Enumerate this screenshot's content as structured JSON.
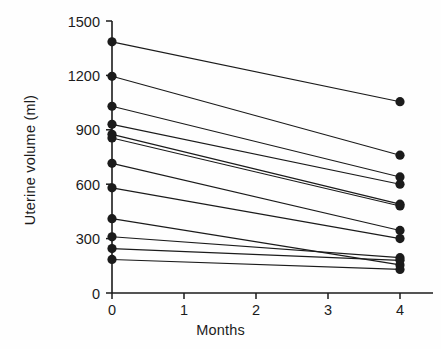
{
  "figure": {
    "background": "#fefefe",
    "ink": "#1b1b1b"
  },
  "labels": {
    "ylabel": "Uterine volume (ml)",
    "xlabel": "Months"
  },
  "axes": {
    "y_ticks": [
      "0",
      "300",
      "600",
      "900",
      "1200",
      "1500"
    ],
    "x_ticks": [
      "0",
      "1",
      "2",
      "3",
      "4"
    ]
  },
  "caption_ghost": "",
  "chart_data": {
    "type": "line",
    "title": "",
    "subtitle": "",
    "xlabel": "Months",
    "ylabel": "Uterine volume (ml)",
    "xlim": [
      0,
      4
    ],
    "ylim": [
      0,
      1500
    ],
    "x_ticks": [
      0,
      1,
      2,
      3,
      4
    ],
    "y_ticks": [
      0,
      300,
      600,
      900,
      1200,
      1500
    ],
    "grid": false,
    "legend": null,
    "legend_position": "none",
    "marker": "filled-circle",
    "marker_positions": "endpoints-only",
    "annotation": "Paired individual patient trajectories; each line connects a baseline (month 0) value to a month 4 value.",
    "x": [
      0,
      4
    ],
    "series": [
      {
        "name": "patient-1",
        "values": [
          1385,
          1055
        ]
      },
      {
        "name": "patient-2",
        "values": [
          1195,
          760
        ]
      },
      {
        "name": "patient-3",
        "values": [
          1030,
          640
        ]
      },
      {
        "name": "patient-4",
        "values": [
          930,
          600
        ]
      },
      {
        "name": "patient-5",
        "values": [
          875,
          490
        ]
      },
      {
        "name": "patient-6",
        "values": [
          855,
          480
        ]
      },
      {
        "name": "patient-7",
        "values": [
          715,
          345
        ]
      },
      {
        "name": "patient-8",
        "values": [
          580,
          300
        ]
      },
      {
        "name": "patient-9",
        "values": [
          410,
          155
        ]
      },
      {
        "name": "patient-10",
        "values": [
          310,
          195
        ]
      },
      {
        "name": "patient-11",
        "values": [
          245,
          180
        ]
      },
      {
        "name": "patient-12",
        "values": [
          185,
          130
        ]
      }
    ]
  }
}
